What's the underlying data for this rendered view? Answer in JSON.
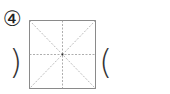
{
  "question": {
    "number_label": "④",
    "paren_close": ")",
    "paren_open": "("
  },
  "grid": {
    "type": "mi-zi-ge",
    "border_color": "#8a8a8a",
    "guide_color": "#9a9a9a"
  }
}
